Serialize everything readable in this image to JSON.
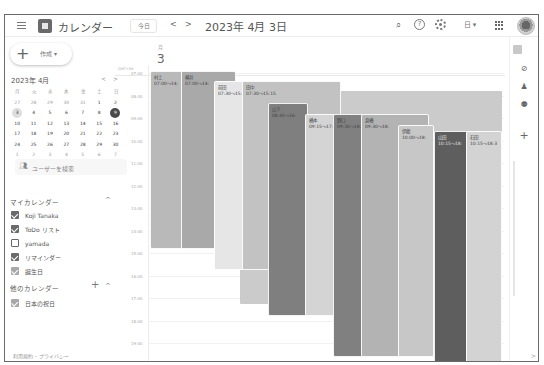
{
  "header": {
    "app_title": "カレンダー",
    "today_label": "今日",
    "prev_label": "<",
    "next_label": ">",
    "date_title": "2023年 4月 3日",
    "view_label": "日 ▾",
    "icons": [
      "menu-icon",
      "calendar-logo-icon",
      "search-icon",
      "help-icon",
      "settings-icon",
      "view-switch-icon",
      "apps-grid-icon",
      "avatar"
    ]
  },
  "sidebar": {
    "create_label": "作成",
    "create_caret": "▾",
    "mini_calendar": {
      "title": "2023年 4月",
      "prev": "<",
      "next": ">",
      "weekdays": [
        "月",
        "火",
        "水",
        "木",
        "金",
        "土",
        "日"
      ],
      "weeks": [
        [
          "27",
          "28",
          "29",
          "30",
          "31",
          "1",
          "2"
        ],
        [
          "3",
          "4",
          "5",
          "6",
          "7",
          "8",
          "9"
        ],
        [
          "10",
          "11",
          "12",
          "13",
          "14",
          "15",
          "16"
        ],
        [
          "17",
          "18",
          "19",
          "20",
          "21",
          "22",
          "23"
        ],
        [
          "24",
          "25",
          "26",
          "27",
          "28",
          "29",
          "30"
        ],
        [
          "1",
          "2",
          "3",
          "4",
          "5",
          "6",
          "7"
        ]
      ],
      "selected_day": "3",
      "today_day": "9"
    },
    "user_search_label": "ユーザーを検索",
    "my_calendars": {
      "title": "マイカレンダー",
      "items": [
        {
          "label": "Koji Tanaka",
          "checked": true
        },
        {
          "label": "ToDo リスト",
          "checked": true
        },
        {
          "label": "yamada",
          "checked": false
        },
        {
          "label": "リマインダー",
          "checked": true
        },
        {
          "label": "誕生日",
          "checked": true
        }
      ]
    },
    "other_calendars": {
      "title": "他のカレンダー",
      "items": [
        {
          "label": "日本の祝日",
          "checked": true
        }
      ]
    },
    "footer": "利用規約 – プライバシー"
  },
  "main": {
    "day_of_week": "月",
    "day_number": "3",
    "timezone": "GMT+09",
    "time_labels": [
      "07:00",
      "08:00",
      "09:00",
      "10:00",
      "11:00",
      "12:00",
      "13:00",
      "14:00",
      "15:00",
      "16:00",
      "17:00",
      "18:00",
      "19:00"
    ],
    "events": [
      {
        "name": "村上",
        "time": "07:00～14:",
        "color": "#b9b9b9"
      },
      {
        "name": "横井",
        "time": "07:00～14:",
        "color": "#a9a9a9"
      },
      {
        "name": "前田",
        "time": "07:30～15:",
        "color": "#e6e6e6"
      },
      {
        "name": "田中",
        "time": "07:30～15:15",
        "color": "#c2c2c2"
      },
      {
        "name": "山下",
        "time": "08:45～16:",
        "color": "#7f7f7f"
      },
      {
        "name": "橋本",
        "time": "09:15～17:",
        "color": "#d4d4d4"
      },
      {
        "name": "野口",
        "time": "09:30～18:",
        "color": "#808080"
      },
      {
        "name": "倉橋",
        "time": "09:30～18:",
        "color": "#b3b3b3"
      },
      {
        "name": "伊藤",
        "time": "10:00～18:",
        "color": "#c7c7c7"
      },
      {
        "name": "山田",
        "time": "10:15～18:",
        "color": "#5e5e5e"
      },
      {
        "name": "石田",
        "time": "10:15～18:3",
        "color": "#d3d3d3"
      }
    ]
  },
  "side_panel": {
    "icons": [
      "keep-icon",
      "tasks-icon",
      "contacts-icon",
      "maps-icon",
      "add-icon"
    ],
    "expand_label": ">"
  }
}
